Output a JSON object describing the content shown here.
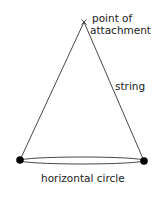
{
  "diagram": {
    "labels": {
      "attachment_line1": "point of",
      "attachment_line2": "attachment",
      "string": "string",
      "circle": "horizontal circle"
    },
    "points": {
      "apex": {
        "x": 84,
        "y": 22
      },
      "left_mass": {
        "x": 20,
        "y": 160
      },
      "right_mass": {
        "x": 144,
        "y": 161
      }
    },
    "colors": {
      "line": "#333333",
      "mass": "#000000",
      "text": "#222222"
    }
  }
}
